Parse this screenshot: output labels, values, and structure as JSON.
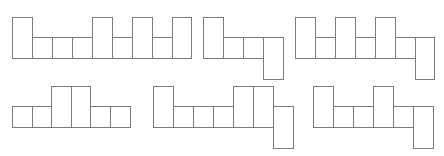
{
  "diagram": {
    "title": "",
    "stroke_color": "#7a7a7a",
    "fill_color": "#ffffff",
    "cell_width": 20,
    "nets": [
      {
        "id": "net-1",
        "cells": [
          {
            "x": 12,
            "y": 17,
            "w": 20,
            "h": 41
          },
          {
            "x": 32,
            "y": 37,
            "w": 20,
            "h": 21
          },
          {
            "x": 52,
            "y": 37,
            "w": 20,
            "h": 21
          },
          {
            "x": 72,
            "y": 37,
            "w": 20,
            "h": 21
          },
          {
            "x": 92,
            "y": 17,
            "w": 20,
            "h": 41
          },
          {
            "x": 112,
            "y": 37,
            "w": 20,
            "h": 21
          },
          {
            "x": 132,
            "y": 17,
            "w": 20,
            "h": 41
          },
          {
            "x": 152,
            "y": 37,
            "w": 20,
            "h": 21
          },
          {
            "x": 172,
            "y": 17,
            "w": 19,
            "h": 41
          }
        ]
      },
      {
        "id": "net-2",
        "cells": [
          {
            "x": 203,
            "y": 17,
            "w": 20,
            "h": 41
          },
          {
            "x": 223,
            "y": 37,
            "w": 20,
            "h": 21
          },
          {
            "x": 243,
            "y": 37,
            "w": 20,
            "h": 21
          },
          {
            "x": 263,
            "y": 37,
            "w": 20,
            "h": 42
          }
        ]
      },
      {
        "id": "net-3",
        "cells": [
          {
            "x": 295,
            "y": 17,
            "w": 20,
            "h": 41
          },
          {
            "x": 315,
            "y": 37,
            "w": 20,
            "h": 21
          },
          {
            "x": 335,
            "y": 17,
            "w": 20,
            "h": 41
          },
          {
            "x": 355,
            "y": 37,
            "w": 20,
            "h": 21
          },
          {
            "x": 375,
            "y": 17,
            "w": 20,
            "h": 41
          },
          {
            "x": 395,
            "y": 37,
            "w": 20,
            "h": 21
          },
          {
            "x": 415,
            "y": 37,
            "w": 19,
            "h": 42
          }
        ]
      },
      {
        "id": "net-4",
        "cells": [
          {
            "x": 12,
            "y": 106,
            "w": 20,
            "h": 21
          },
          {
            "x": 32,
            "y": 106,
            "w": 19,
            "h": 21
          },
          {
            "x": 51,
            "y": 86,
            "w": 20,
            "h": 41
          },
          {
            "x": 71,
            "y": 86,
            "w": 19,
            "h": 41
          },
          {
            "x": 90,
            "y": 106,
            "w": 20,
            "h": 21
          },
          {
            "x": 110,
            "y": 106,
            "w": 20,
            "h": 21
          }
        ]
      },
      {
        "id": "net-5",
        "cells": [
          {
            "x": 153,
            "y": 86,
            "w": 20,
            "h": 41
          },
          {
            "x": 173,
            "y": 106,
            "w": 20,
            "h": 21
          },
          {
            "x": 193,
            "y": 106,
            "w": 20,
            "h": 21
          },
          {
            "x": 213,
            "y": 106,
            "w": 20,
            "h": 21
          },
          {
            "x": 233,
            "y": 86,
            "w": 20,
            "h": 41
          },
          {
            "x": 253,
            "y": 86,
            "w": 20,
            "h": 41
          },
          {
            "x": 273,
            "y": 106,
            "w": 20,
            "h": 42
          }
        ]
      },
      {
        "id": "net-6",
        "cells": [
          {
            "x": 313,
            "y": 86,
            "w": 20,
            "h": 41
          },
          {
            "x": 333,
            "y": 106,
            "w": 20,
            "h": 21
          },
          {
            "x": 353,
            "y": 106,
            "w": 20,
            "h": 21
          },
          {
            "x": 373,
            "y": 86,
            "w": 20,
            "h": 41
          },
          {
            "x": 393,
            "y": 106,
            "w": 20,
            "h": 21
          },
          {
            "x": 413,
            "y": 106,
            "w": 20,
            "h": 42
          }
        ]
      }
    ]
  }
}
